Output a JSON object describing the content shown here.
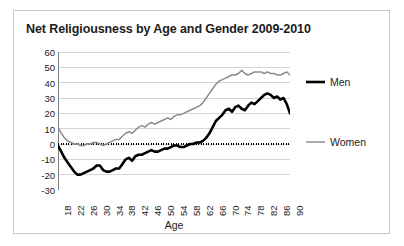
{
  "chart": {
    "title": "Net Religiousness by Age and Gender 2009-2010",
    "xlabel": "Age",
    "ylabel": "",
    "y_ticks": [
      "60",
      "50",
      "40",
      "30",
      "20",
      "10",
      "0",
      "-10",
      "-20",
      "-30"
    ],
    "x_ticks": [
      "18",
      "22",
      "26",
      "30",
      "34",
      "38",
      "42",
      "46",
      "50",
      "54",
      "58",
      "62",
      "66",
      "70",
      "74",
      "78",
      "82",
      "86",
      "90"
    ],
    "legend": [
      {
        "label": "Men",
        "color": "#000000",
        "width": 2.6
      },
      {
        "label": "Women",
        "color": "#8c8c8c",
        "width": 1.5
      }
    ],
    "colors": {
      "men": "#000000",
      "women": "#8c8c8c",
      "gridline": "#d4d4d4",
      "axis": "#808080",
      "frame": "#c8c8c8",
      "zero_line": "#000000",
      "text": "#1b1b1b"
    }
  },
  "chart_data": {
    "type": "line",
    "title": "Net Religiousness by Age and Gender 2009-2010",
    "xlabel": "Age",
    "ylabel": "",
    "xlim": [
      18,
      90
    ],
    "ylim": [
      -30,
      60
    ],
    "ytick_step": 10,
    "xtick_step": 4,
    "grid": true,
    "legend_position": "right",
    "annotations": [
      "dotted reference line at y = 0"
    ],
    "x": [
      18,
      19,
      20,
      21,
      22,
      23,
      24,
      25,
      26,
      27,
      28,
      29,
      30,
      31,
      32,
      33,
      34,
      35,
      36,
      37,
      38,
      39,
      40,
      41,
      42,
      43,
      44,
      45,
      46,
      47,
      48,
      49,
      50,
      51,
      52,
      53,
      54,
      55,
      56,
      57,
      58,
      59,
      60,
      61,
      62,
      63,
      64,
      65,
      66,
      67,
      68,
      69,
      70,
      71,
      72,
      73,
      74,
      75,
      76,
      77,
      78,
      79,
      80,
      81,
      82,
      83,
      84,
      85,
      86,
      87,
      88,
      89,
      90
    ],
    "series": [
      {
        "name": "Men",
        "color": "#000000",
        "values": [
          -1,
          -5,
          -9,
          -12,
          -15,
          -18,
          -20,
          -20,
          -19,
          -18,
          -17,
          -16,
          -14,
          -14,
          -17,
          -18,
          -18,
          -17,
          -16,
          -16,
          -13,
          -10,
          -9,
          -11,
          -8,
          -7,
          -7,
          -6,
          -5,
          -4,
          -5,
          -5,
          -4,
          -3,
          -3,
          -2,
          -1,
          -1,
          -2,
          -2,
          -1,
          0,
          0,
          1,
          1,
          2,
          4,
          7,
          11,
          15,
          17,
          19,
          22,
          23,
          21,
          24,
          25,
          23,
          22,
          25,
          27,
          26,
          28,
          30,
          32,
          33,
          32,
          30,
          31,
          29,
          30,
          26,
          20
        ]
      },
      {
        "name": "Women",
        "color": "#8c8c8c",
        "values": [
          11,
          7,
          4,
          2,
          1,
          0,
          0,
          -1,
          -1,
          0,
          0,
          1,
          1,
          0,
          -1,
          0,
          1,
          2,
          3,
          3,
          5,
          7,
          8,
          7,
          9,
          11,
          12,
          11,
          13,
          14,
          13,
          14,
          15,
          16,
          17,
          16,
          18,
          19,
          19,
          20,
          21,
          22,
          23,
          24,
          25,
          27,
          30,
          33,
          36,
          39,
          41,
          42,
          43,
          44,
          45,
          45,
          46,
          48,
          46,
          45,
          46,
          47,
          47,
          47,
          46,
          47,
          46,
          46,
          45,
          45,
          46,
          47,
          45
        ]
      }
    ]
  }
}
